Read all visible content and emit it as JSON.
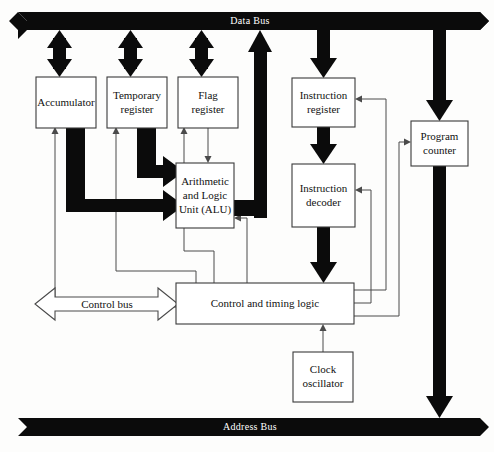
{
  "diagram": {
    "colors": {
      "bus_fill": "#0b0b0b",
      "bus_text": "#ffffff",
      "box_stroke": "#3a3a3a",
      "box_fill": "#ffffff",
      "thin_line": "#4a4a4a",
      "background": "#fdfdfc"
    },
    "buses": [
      {
        "id": "data-bus",
        "label": "Data Bus",
        "x": 18,
        "y": 12,
        "w": 462,
        "h": 18,
        "notch": 9,
        "label_x": 250,
        "label_y": 21
      },
      {
        "id": "address-bus",
        "label": "Address Bus",
        "x": 18,
        "y": 418,
        "w": 462,
        "h": 18,
        "notch": 9,
        "label_x": 250,
        "label_y": 427
      }
    ],
    "blocks": [
      {
        "id": "accumulator",
        "label_lines": [
          "Accumulator"
        ],
        "x": 36,
        "y": 77,
        "w": 60,
        "h": 51
      },
      {
        "id": "temporary-register",
        "label_lines": [
          "Temporary",
          "register"
        ],
        "x": 107,
        "y": 77,
        "w": 60,
        "h": 51
      },
      {
        "id": "flag-register",
        "label_lines": [
          "Flag",
          "register"
        ],
        "x": 178,
        "y": 77,
        "w": 60,
        "h": 51
      },
      {
        "id": "alu",
        "label_lines": [
          "Arithmetic",
          "and Logic",
          "Unit (ALU)"
        ],
        "x": 176,
        "y": 163,
        "w": 58,
        "h": 65
      },
      {
        "id": "instruction-register",
        "label_lines": [
          "Instruction",
          "register"
        ],
        "x": 292,
        "y": 78,
        "w": 63,
        "h": 49
      },
      {
        "id": "instruction-decoder",
        "label_lines": [
          "Instruction",
          "decoder"
        ],
        "x": 292,
        "y": 164,
        "w": 63,
        "h": 63
      },
      {
        "id": "program-counter",
        "label_lines": [
          "Program",
          "counter"
        ],
        "x": 411,
        "y": 121,
        "w": 57,
        "h": 45
      },
      {
        "id": "control-timing-logic",
        "label_lines": [
          "Control and timing logic"
        ],
        "x": 176,
        "y": 283,
        "w": 178,
        "h": 41
      },
      {
        "id": "clock-oscillator",
        "label_lines": [
          "Clock",
          "oscillator"
        ],
        "x": 293,
        "y": 352,
        "w": 60,
        "h": 50
      }
    ],
    "control_bus": {
      "id": "control-bus",
      "label": "Control bus",
      "x": 35,
      "y": 288,
      "w": 143,
      "h": 32,
      "label_x": 106,
      "label_y": 304
    },
    "fat_arrows": [
      {
        "id": "databus-to-accumulator",
        "kind": "vertical-double",
        "x": 59,
        "y1": 30,
        "y2": 77
      },
      {
        "id": "databus-to-temporary-register",
        "kind": "vertical-double",
        "x": 130,
        "y1": 30,
        "y2": 77
      },
      {
        "id": "databus-to-flag-register",
        "kind": "vertical-double",
        "x": 202,
        "y1": 30,
        "y2": 77
      },
      {
        "id": "databus-to-instruction-register",
        "kind": "vertical-down",
        "x": 323,
        "y1": 30,
        "y2": 78
      },
      {
        "id": "instruction-register-to-decoder",
        "kind": "vertical-down",
        "x": 323,
        "y1": 127,
        "y2": 164
      },
      {
        "id": "decoder-to-control-logic",
        "kind": "vertical-down",
        "x": 323,
        "y1": 227,
        "y2": 283
      },
      {
        "id": "databus-to-program-counter",
        "kind": "vertical-down",
        "x": 439,
        "y1": 30,
        "y2": 121
      },
      {
        "id": "program-counter-to-address-bus",
        "kind": "vertical-down",
        "x": 439,
        "y1": 166,
        "y2": 418
      }
    ],
    "fat_paths": [
      {
        "id": "accumulator-to-alu",
        "desc": "Accumulator output down and right into ALU lower input"
      },
      {
        "id": "temporary-register-to-alu",
        "desc": "Temporary register output down and right into ALU upper input"
      },
      {
        "id": "alu-to-databus",
        "desc": "ALU result right then up into Data Bus"
      }
    ],
    "thin_links": [
      {
        "id": "control-to-accumulator",
        "desc": "Control logic to Accumulator load"
      },
      {
        "id": "control-to-temporary-register",
        "desc": "Control logic to Temporary register load"
      },
      {
        "id": "control-to-flag-register",
        "desc": "Control logic to Flag register load"
      },
      {
        "id": "control-to-alu",
        "desc": "Control logic to ALU operation select"
      },
      {
        "id": "alu-to-flag-register",
        "desc": "ALU status flags to Flag register"
      },
      {
        "id": "control-to-instruction-register",
        "desc": "Control logic to Instruction register"
      },
      {
        "id": "control-to-instruction-decoder",
        "desc": "Control logic to Instruction decoder"
      },
      {
        "id": "control-to-program-counter",
        "desc": "Control logic to Program counter"
      },
      {
        "id": "clock-to-control",
        "desc": "Clock oscillator to Control and timing logic"
      }
    ]
  }
}
